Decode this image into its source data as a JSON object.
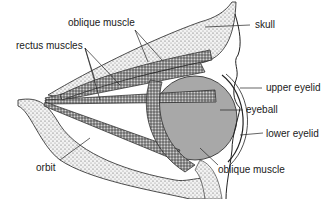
{
  "diagram": {
    "title": "",
    "labels": {
      "skull": "skull",
      "oblique_muscle_top": "oblique muscle",
      "rectus_muscles": "rectus muscles",
      "upper_eyelid": "upper eyelid",
      "eyeball": "eyeball",
      "lower_eyelid": "lower eyelid",
      "orbit": "orbit",
      "oblique_muscle_bottom": "oblique muscle"
    },
    "colors": {
      "eyeball": "#a8a8a8",
      "bone_stipple": "#d8d8d8",
      "muscle": "#8a8a8a",
      "ink": "#1a1a1a"
    }
  }
}
